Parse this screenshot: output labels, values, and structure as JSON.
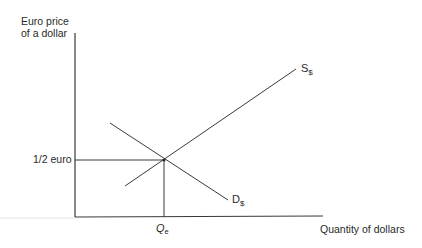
{
  "diagram": {
    "type": "supply-demand",
    "y_axis_label_line1": "Euro price",
    "y_axis_label_line2": "of a dollar",
    "x_axis_label": "Quantity of dollars",
    "price_tick_label": "1/2 euro",
    "quantity_tick_main": "Q",
    "quantity_tick_sub": "e",
    "supply_curve": {
      "main": "S",
      "sub": "$"
    },
    "demand_curve": {
      "main": "D",
      "sub": "$"
    },
    "colors": {
      "line": "#3a3a3a",
      "faint": "#e0e0e0"
    }
  }
}
